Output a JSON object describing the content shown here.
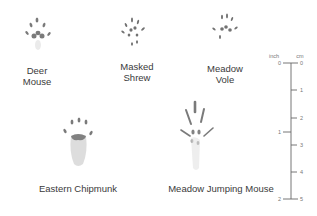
{
  "tracks": [
    {
      "id": "deer-mouse",
      "label_line1": "Deer",
      "label_line2": "Mouse"
    },
    {
      "id": "masked-shrew",
      "label_line1": "Masked",
      "label_line2": "Shrew"
    },
    {
      "id": "meadow-vole",
      "label_line1": "Meadow",
      "label_line2": "Vole"
    },
    {
      "id": "eastern-chipmunk",
      "label_line1": "Eastern Chipmunk",
      "label_line2": ""
    },
    {
      "id": "meadow-jumping-mouse",
      "label_line1": "Meadow Jumping Mouse",
      "label_line2": ""
    }
  ],
  "ruler": {
    "inch_label": "inch",
    "cm_label": "cm",
    "inch_ticks": [
      "0",
      "1",
      "2"
    ],
    "cm_ticks": [
      "0",
      "1",
      "2",
      "3",
      "4",
      "5"
    ]
  },
  "colors": {
    "print": "#5a5a5a",
    "ruler": "#666666",
    "text": "#3a3a3a"
  }
}
